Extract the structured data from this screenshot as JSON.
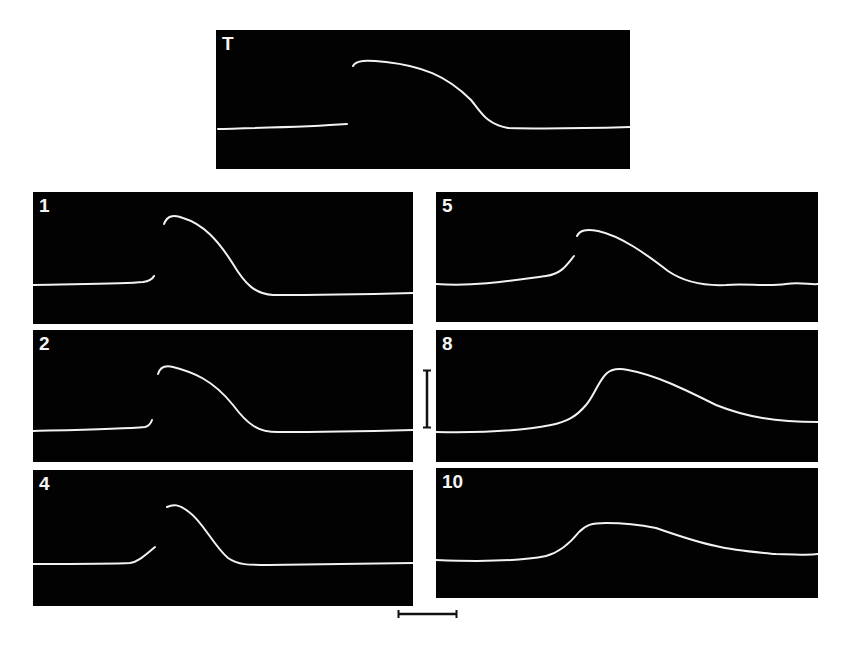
{
  "figure": {
    "colors": {
      "background": "#ffffff",
      "panel": "#020202",
      "trace": "#f2f2f2",
      "scalebar": "#111111"
    },
    "panels": [
      {
        "id": "T",
        "label": "T",
        "box": [
          216,
          30,
          414,
          139
        ],
        "trace": "M2,99 C40,98 90,97 131,94 M137,36 C140,30 150,30 170,32 C205,36 230,45 255,70 C265,82 270,94 292,98 C330,99 380,98 414,97"
      },
      {
        "id": "1",
        "label": "1",
        "box": [
          33,
          192,
          380,
          132
        ],
        "trace": "M0,93 C40,92 90,92 110,90 C117,89 120,86 121,84 M131,32 C134,24 140,22 150,26 C170,32 185,48 200,72 C212,92 222,102 240,103 C290,103 340,102 380,101"
      },
      {
        "id": "2",
        "label": "2",
        "box": [
          33,
          330,
          380,
          132
        ],
        "trace": "M0,101 C40,100 90,99 112,97 C116,96 118,93 119,90 M125,44 C127,37 132,35 140,37 C160,42 180,50 200,75 C215,95 225,102 245,102 C290,102 340,101 380,100"
      },
      {
        "id": "4",
        "label": "4",
        "box": [
          33,
          470,
          380,
          136
        ],
        "trace": "M0,94 C30,94 80,94 97,93 C105,92 112,85 122,77 M134,37 C140,34 146,34 156,42 C170,52 180,75 195,88 C205,95 215,95 235,95 C290,94 340,94 380,93"
      },
      {
        "id": "5",
        "label": "5",
        "box": [
          436,
          192,
          382,
          130
        ],
        "trace": "M0,92 C40,95 80,88 110,84 C125,82 130,74 138,64 M141,44 C144,38 150,37 162,39 C185,44 210,62 232,79 C248,90 268,94 290,93 C310,91 330,95 350,92 C365,90 375,93 382,92"
      },
      {
        "id": "8",
        "label": "8",
        "box": [
          436,
          330,
          382,
          132
        ],
        "trace": "M0,102 C50,103 90,100 115,95 C130,92 140,87 150,75 C158,66 162,52 170,44 C175,39 182,38 192,40 C220,45 250,60 280,75 C310,87 340,92 382,92"
      },
      {
        "id": "10",
        "label": "10",
        "box": [
          436,
          468,
          382,
          130
        ],
        "trace": "M0,92 C50,94 90,92 110,88 C125,84 135,74 143,64 C150,57 155,55 170,55 C190,55 205,57 220,60 C240,67 260,74 280,78 C300,83 320,84 340,86 C360,86 370,88 382,86"
      }
    ],
    "scalebars": [
      {
        "name": "vertical-scale-bar",
        "orientation": "vertical",
        "x": 427,
        "y1": 370,
        "y2": 428
      },
      {
        "name": "horizontal-scale-bar",
        "orientation": "horizontal",
        "y": 614,
        "x1": 398,
        "x2": 457
      }
    ]
  }
}
